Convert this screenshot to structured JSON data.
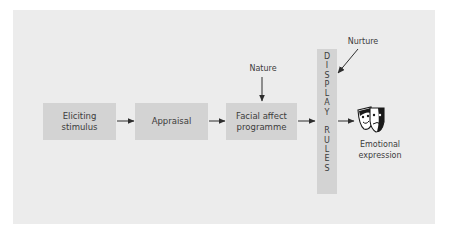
{
  "diagram": {
    "nodes": [
      {
        "id": "eliciting",
        "lines": [
          "Eliciting",
          "stimulus"
        ]
      },
      {
        "id": "appraisal",
        "lines": [
          "Appraisal"
        ]
      },
      {
        "id": "facial",
        "lines": [
          "Facial affect",
          "programme"
        ]
      }
    ],
    "display_rules": {
      "word1": [
        "D",
        "I",
        "S",
        "P",
        "L",
        "A",
        "Y"
      ],
      "word2": [
        "R",
        "U",
        "L",
        "E",
        "S"
      ]
    },
    "labels": {
      "nature": "Nature",
      "nurture": "Nurture",
      "output_line1": "Emotional",
      "output_line2": "expression"
    },
    "icons": {
      "output": "theatre-masks-icon"
    },
    "edges": [
      {
        "from": "eliciting",
        "to": "appraisal"
      },
      {
        "from": "appraisal",
        "to": "facial"
      },
      {
        "from": "facial",
        "to": "display_rules"
      },
      {
        "from": "display_rules",
        "to": "emotional_expression"
      },
      {
        "from": "nature",
        "to": "facial"
      },
      {
        "from": "nurture",
        "to": "display_rules"
      }
    ],
    "colors": {
      "panel": "#ececec",
      "box": "#d3d3d3",
      "text": "#3c3c3c",
      "arrow": "#2e2e2e"
    }
  }
}
